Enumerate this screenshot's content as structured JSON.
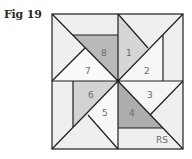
{
  "figure": {
    "label": "Fig 19",
    "corner_tag": "RS"
  },
  "pieces": [
    {
      "id": "1",
      "label": "1"
    },
    {
      "id": "2",
      "label": "2"
    },
    {
      "id": "3",
      "label": "3"
    },
    {
      "id": "4",
      "label": "4"
    },
    {
      "id": "5",
      "label": "5"
    },
    {
      "id": "6",
      "label": "6"
    },
    {
      "id": "7",
      "label": "7"
    },
    {
      "id": "8",
      "label": "8"
    }
  ],
  "colors": {
    "background_patch": "#efefef",
    "light_patch": "#f7f7f7",
    "medium_patch": "#d4d4d4",
    "dark_patch": "#b0b0b0",
    "line": "#1e1e1e",
    "number": "#6a6a6a"
  }
}
